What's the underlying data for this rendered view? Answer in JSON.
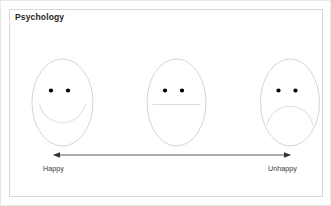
{
  "slide": {
    "title": "Psychology",
    "background_color": "#ffffff",
    "border_color": "#d8d8d8"
  },
  "diagram": {
    "name": "happiness-continuum",
    "faces": [
      {
        "id": "happy-face",
        "expression": "happy",
        "mouth": "smile",
        "position": "left",
        "cx": 61.5,
        "cy": 101.5,
        "rx": 30.5,
        "ry": 43.5,
        "eye_left_x": 50,
        "eye_right_x": 67,
        "eye_y": 89.5,
        "eye_r": 2.1
      },
      {
        "id": "neutral-face",
        "expression": "neutral",
        "mouth": "straight",
        "position": "center",
        "cx": 175.5,
        "cy": 101.5,
        "rx": 29.5,
        "ry": 43.5,
        "eye_left_x": 164,
        "eye_right_x": 181,
        "eye_y": 89.5,
        "eye_r": 2.1
      },
      {
        "id": "unhappy-face",
        "expression": "unhappy",
        "mouth": "frown",
        "position": "right",
        "cx": 289,
        "cy": 101.5,
        "rx": 29.5,
        "ry": 43.5,
        "eye_left_x": 277.5,
        "eye_right_x": 294.5,
        "eye_y": 89.5,
        "eye_r": 2.1
      }
    ],
    "face_outline_color": "#c9c9c9",
    "mouth_color": "#dddddd",
    "eye_color": "#000000",
    "axis": {
      "y": 154,
      "x_start": 52,
      "x_end": 290,
      "color": "#333333",
      "double_headed": true,
      "left_label": "Happy",
      "right_label": "Unhappy"
    }
  }
}
